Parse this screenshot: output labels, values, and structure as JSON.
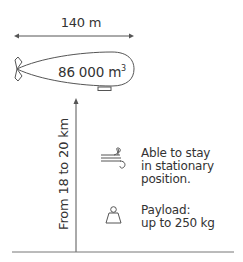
{
  "diagram": {
    "dimensions": {
      "length_label": "140 m",
      "volume_value": "86 000 m",
      "volume_unit_exponent": "3"
    },
    "altitude_label": "From 18 to 20 km",
    "features": [
      {
        "icon": "wind-icon",
        "lines": [
          "Able to stay",
          "in stationary",
          "position."
        ]
      },
      {
        "icon": "weight-icon",
        "lines": [
          "Payload:",
          "up to 250 kg"
        ]
      }
    ],
    "colors": {
      "stroke": "#555555",
      "text": "#333333",
      "background": "#ffffff"
    }
  }
}
